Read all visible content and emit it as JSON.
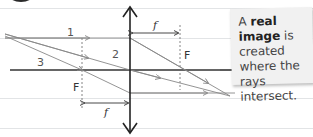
{
  "diagram": {
    "ray_labels": [
      "1",
      "2",
      "3"
    ],
    "focal_point_label": "F",
    "focal_length_label": "f",
    "colors": {
      "axis": "#333333",
      "rays": "#888888",
      "lens": "#222222",
      "ruled_lines": "#e2e4e6",
      "note_background": "#f1f1f1"
    }
  },
  "note": {
    "prefix": "A ",
    "bold": "real image",
    "rest": " is created where the rays intersect."
  }
}
